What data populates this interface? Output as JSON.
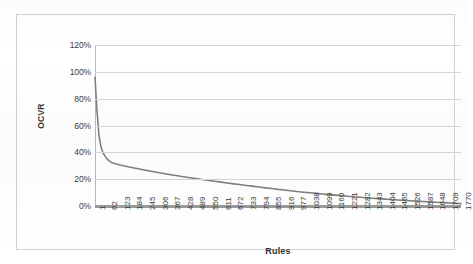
{
  "chart_data": {
    "type": "line",
    "title": "",
    "xlabel": "Rules",
    "ylabel": "OCVR",
    "xlim": [
      1,
      1770
    ],
    "ylim": [
      0,
      1.2
    ],
    "grid": true,
    "legend": false,
    "legend_position": "none",
    "series_color": "#808080",
    "y_tick_labels": [
      "120%",
      "100%",
      "80%",
      "60%",
      "40%",
      "20%",
      "0%"
    ],
    "y_tick_values": [
      1.2,
      1.0,
      0.8,
      0.6,
      0.4,
      0.2,
      0.0
    ],
    "x_tick_labels": [
      "1",
      "62",
      "123",
      "184",
      "245",
      "306",
      "367",
      "428",
      "489",
      "550",
      "611",
      "672",
      "733",
      "794",
      "855",
      "916",
      "977",
      "1038",
      "1099",
      "1160",
      "1221",
      "1282",
      "1343",
      "1404",
      "1465",
      "1526",
      "1587",
      "1648",
      "1709",
      "1770"
    ],
    "x_tick_values": [
      1,
      62,
      123,
      184,
      245,
      306,
      367,
      428,
      489,
      550,
      611,
      672,
      733,
      794,
      855,
      916,
      977,
      1038,
      1099,
      1160,
      1221,
      1282,
      1343,
      1404,
      1465,
      1526,
      1587,
      1648,
      1709,
      1770
    ],
    "series": [
      {
        "name": "OCVR",
        "x": [
          1,
          10,
          20,
          30,
          40,
          50,
          62,
          80,
          100,
          123,
          160,
          184,
          210,
          245,
          280,
          306,
          340,
          367,
          400,
          428,
          460,
          489,
          520,
          550,
          580,
          611,
          640,
          672,
          700,
          733,
          760,
          794,
          825,
          855,
          885,
          916,
          945,
          977,
          1010,
          1038,
          1070,
          1099,
          1130,
          1160,
          1190,
          1221,
          1250,
          1282,
          1310,
          1343,
          1370,
          1404,
          1435,
          1465,
          1495,
          1526,
          1555,
          1587,
          1615,
          1648,
          1680,
          1709,
          1740,
          1770
        ],
        "values": [
          0.96,
          0.72,
          0.53,
          0.44,
          0.395,
          0.37,
          0.345,
          0.325,
          0.315,
          0.305,
          0.292,
          0.285,
          0.277,
          0.267,
          0.257,
          0.25,
          0.24,
          0.233,
          0.225,
          0.218,
          0.211,
          0.205,
          0.197,
          0.191,
          0.184,
          0.178,
          0.172,
          0.165,
          0.16,
          0.153,
          0.148,
          0.141,
          0.135,
          0.13,
          0.124,
          0.119,
          0.114,
          0.108,
          0.103,
          0.099,
          0.094,
          0.09,
          0.085,
          0.081,
          0.077,
          0.073,
          0.069,
          0.065,
          0.062,
          0.058,
          0.055,
          0.051,
          0.048,
          0.045,
          0.042,
          0.039,
          0.036,
          0.033,
          0.031,
          0.028,
          0.026,
          0.023,
          0.021,
          0.018
        ]
      }
    ]
  },
  "chart": {
    "y_axis_title": "OCVR",
    "x_axis_title": "Rules"
  }
}
